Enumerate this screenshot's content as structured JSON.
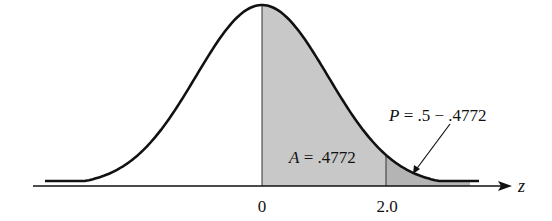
{
  "chart_data": {
    "type": "area",
    "title": "",
    "xlabel": "z",
    "ylabel": "",
    "tick_labels": [
      "0",
      "2.0"
    ],
    "x_ticks": [
      0,
      2.0
    ],
    "shaded_regions": [
      {
        "from": 0,
        "to": 2.0,
        "label": "A = .4772",
        "area": 0.4772
      },
      {
        "from": 2.0,
        "to": "inf",
        "label": "P = .5 − .4772",
        "area": 0.0228
      }
    ],
    "annotations": [
      {
        "text": "A = .4772",
        "x": 1.0
      },
      {
        "text": "P = .5 − .4772",
        "points_to": 2.3
      }
    ],
    "xlim": [
      -3.7,
      3.6
    ],
    "grid": false
  },
  "labels": {
    "area": "A = .4772",
    "area_var": "A",
    "area_rest": " = .4772",
    "p_var": "P",
    "p_rest": " = .5 − .4772",
    "zero": "0",
    "two": "2.0",
    "axis": "z"
  },
  "colors": {
    "shade": "#c8c8c8",
    "tail": "#b4b4b4",
    "line": "#111111"
  }
}
